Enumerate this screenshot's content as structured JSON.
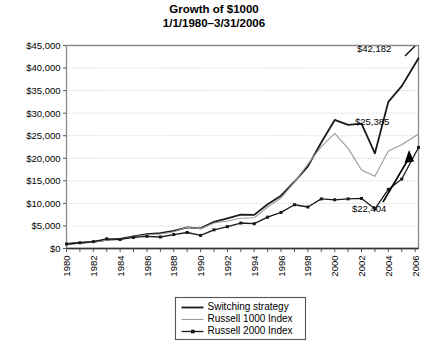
{
  "chart_data": {
    "type": "line",
    "title": "Growth of $1000",
    "subtitle": "1/1/1980–3/31/2006",
    "xlabel": "",
    "ylabel": "",
    "xlim": [
      1980,
      2006.25
    ],
    "ylim": [
      0,
      45000
    ],
    "grid": true,
    "grid_axis": "y",
    "legend_position": "bottom-center",
    "ytick_labels": [
      "$0",
      "$5,000",
      "$10,000",
      "$15,000",
      "$20,000",
      "$25,000",
      "$30,000",
      "$35,000",
      "$40,000",
      "$45,000"
    ],
    "ytick_values": [
      0,
      5000,
      10000,
      15000,
      20000,
      25000,
      30000,
      35000,
      40000,
      45000
    ],
    "xtick_labels": [
      "1980",
      "1982",
      "1984",
      "1986",
      "1988",
      "1990",
      "1992",
      "1994",
      "1996",
      "1998",
      "2000",
      "2002",
      "2004",
      "2006"
    ],
    "xtick_values": [
      1980,
      1982,
      1984,
      1986,
      1988,
      1990,
      1992,
      1994,
      1996,
      1998,
      2000,
      2002,
      2004,
      2006
    ],
    "x": [
      1980,
      1981,
      1982,
      1983,
      1984,
      1985,
      1986,
      1987,
      1988,
      1989,
      1990,
      1991,
      1992,
      1993,
      1994,
      1995,
      1996,
      1997,
      1998,
      1999,
      2000,
      2001,
      2002,
      2003,
      2004,
      2005,
      2006.25
    ],
    "series": [
      {
        "name": "Switching strategy",
        "color": "#1a1a1a",
        "width": 1.8,
        "markers": false,
        "values": [
          1000,
          1250,
          1480,
          1900,
          2150,
          2700,
          3200,
          3400,
          3900,
          4700,
          4450,
          5900,
          6700,
          7500,
          7450,
          9800,
          11700,
          14800,
          18200,
          23500,
          28500,
          27400,
          27700,
          21100,
          32500,
          36000,
          42182
        ]
      },
      {
        "name": "Russell 1000 Index",
        "color": "#9a9a9a",
        "width": 1.1,
        "markers": false,
        "values": [
          1000,
          1220,
          1450,
          1850,
          2000,
          2600,
          3050,
          3200,
          3700,
          4700,
          4400,
          5650,
          6100,
          6700,
          6800,
          9200,
          11200,
          14700,
          18700,
          22600,
          25500,
          22200,
          17400,
          16000,
          21600,
          23000,
          25385
        ]
      },
      {
        "name": "Russell 2000 Index",
        "color": "#1a1a1a",
        "width": 1.3,
        "markers": true,
        "values": [
          1000,
          1280,
          1520,
          2150,
          2000,
          2450,
          2700,
          2550,
          3100,
          3550,
          2900,
          4150,
          4850,
          5650,
          5500,
          6950,
          8000,
          9700,
          9200,
          11000,
          10800,
          11000,
          11100,
          8800,
          13100,
          15400,
          22404
        ]
      }
    ],
    "annotations": [
      {
        "text": "$42,182",
        "series": "Switching strategy",
        "value": 42182
      },
      {
        "text": "$25,385",
        "series": "Russell 1000 Index",
        "value": 25385
      },
      {
        "text": "$22,404",
        "series": "Russell 2000 Index",
        "value": 22404,
        "arrow": true
      }
    ],
    "legend": [
      {
        "label": "Switching strategy",
        "color": "#1a1a1a",
        "width": 1.8,
        "marker": false
      },
      {
        "label": "Russell 1000 Index",
        "color": "#9a9a9a",
        "width": 1.1,
        "marker": false
      },
      {
        "label": "Russell 2000 Index",
        "color": "#1a1a1a",
        "width": 1.3,
        "marker": true
      }
    ]
  }
}
